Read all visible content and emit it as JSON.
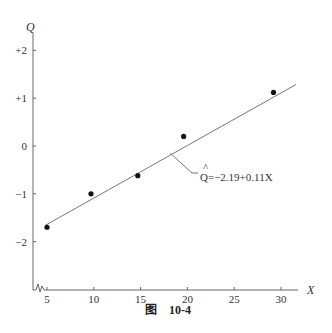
{
  "chart_data": {
    "type": "scatter",
    "title": "",
    "caption": "图    10-4",
    "caption_prefix": "图",
    "caption_number": "10-4",
    "xlabel": "X",
    "ylabel": "Q",
    "xlim": [
      4,
      32
    ],
    "ylim": [
      -3,
      2.4
    ],
    "x_ticks": [
      5,
      10,
      15,
      20,
      25,
      30
    ],
    "x_tick_labels": [
      "5",
      "10",
      "15",
      "20",
      "25",
      "30"
    ],
    "y_ticks": [
      2,
      1,
      0,
      -1,
      -2
    ],
    "y_tick_labels": [
      "+2",
      "+1",
      "0",
      "−1",
      "−2"
    ],
    "grid": false,
    "axis_break": "x-axis near origin (zigzag)",
    "points": [
      {
        "x": 5,
        "y": -1.7
      },
      {
        "x": 9.7,
        "y": -1.0
      },
      {
        "x": 14.7,
        "y": -0.62
      },
      {
        "x": 19.6,
        "y": 0.2
      },
      {
        "x": 29.2,
        "y": 1.12
      }
    ],
    "fit_line": {
      "intercept": -2.19,
      "slope": 0.11,
      "x_range": [
        4.8,
        31.6
      ],
      "label": "Q̂=−2.19+0.11X",
      "label_hat": "^",
      "label_text": "Q=−2.19+0.11X"
    }
  }
}
